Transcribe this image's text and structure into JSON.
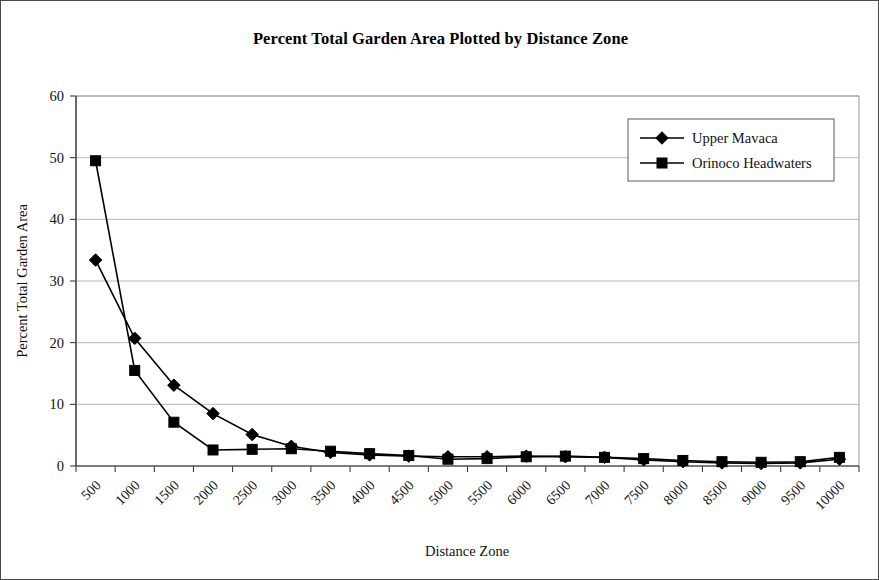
{
  "chart_data": {
    "type": "line",
    "title": "Percent Total Garden Area Plotted by Distance Zone",
    "xlabel": "Distance Zone",
    "ylabel": "Percent Total Garden Area",
    "categories": [
      "500",
      "1000",
      "1500",
      "2000",
      "2500",
      "3000",
      "3500",
      "4000",
      "4500",
      "5000",
      "5500",
      "6000",
      "6500",
      "7000",
      "7500",
      "8000",
      "8500",
      "9000",
      "9500",
      "10000"
    ],
    "ylim": [
      0,
      60
    ],
    "yticks": [
      "0",
      "10",
      "20",
      "30",
      "40",
      "50",
      "60"
    ],
    "grid": true,
    "legend_position": "top-right",
    "series": [
      {
        "name": "Upper Mavaca",
        "marker": "diamond",
        "color": "#000000",
        "values": [
          33.4,
          20.7,
          13.1,
          8.5,
          5.1,
          3.2,
          2.2,
          1.8,
          1.6,
          1.5,
          1.5,
          1.6,
          1.5,
          1.4,
          1.0,
          0.7,
          0.5,
          0.4,
          0.5,
          1.1
        ]
      },
      {
        "name": "Orinoco Headwaters",
        "marker": "square",
        "color": "#000000",
        "values": [
          49.5,
          15.5,
          7.1,
          2.6,
          2.7,
          2.8,
          2.4,
          2.0,
          1.7,
          1.1,
          1.2,
          1.5,
          1.6,
          1.4,
          1.2,
          0.9,
          0.7,
          0.6,
          0.7,
          1.4
        ]
      }
    ]
  },
  "layout": {
    "plot_left": 75,
    "plot_right": 858,
    "plot_top": 95,
    "plot_bottom": 465
  }
}
